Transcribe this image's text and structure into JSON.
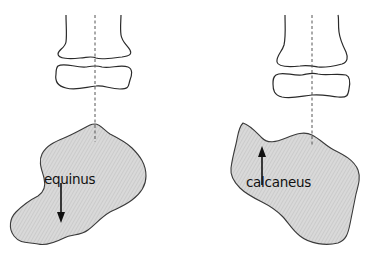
{
  "figure": {
    "panels": [
      {
        "id": "left",
        "label": "equinus",
        "arrow_direction": "down"
      },
      {
        "id": "right",
        "label": "calcaneus",
        "arrow_direction": "up"
      }
    ]
  },
  "colors": {
    "bone_outline": "#2a2a2a",
    "calcaneus_fill": "#d4d4d4",
    "axis_line": "#555555",
    "arrow": "#111111"
  }
}
